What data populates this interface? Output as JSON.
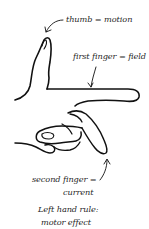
{
  "diagram": {
    "title": "Left hand rule: motor effect",
    "labels": {
      "thumb": "thumb = motion",
      "first_finger": "first finger = field",
      "second_finger_line1": "second finger =",
      "second_finger_line2": "current"
    },
    "caption": {
      "line1": "Left hand rule:",
      "line2": "motor effect"
    },
    "colors": {
      "ink": "#111111",
      "text": "#1f1f1f",
      "background": "#ffffff"
    }
  }
}
